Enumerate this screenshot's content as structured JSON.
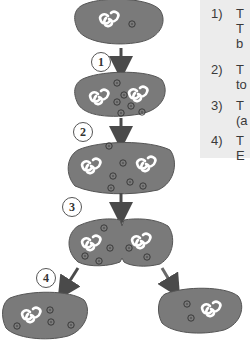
{
  "colors": {
    "cell_fill": "#7a7a7a",
    "cell_stroke": "#555555",
    "dna": "#ffffff",
    "plasmid_stroke": "#444444",
    "arrow": "#4a4a4a",
    "panel_bg": "#ececec"
  },
  "step_labels": [
    "1",
    "2",
    "3",
    "4"
  ],
  "panel": {
    "items": [
      {
        "num": "1)",
        "text": "T\nT\nb"
      },
      {
        "num": "2)",
        "text": "T\nto"
      },
      {
        "num": "3)",
        "text": "T\n(a"
      },
      {
        "num": "4)",
        "text": "T\nE"
      }
    ]
  }
}
